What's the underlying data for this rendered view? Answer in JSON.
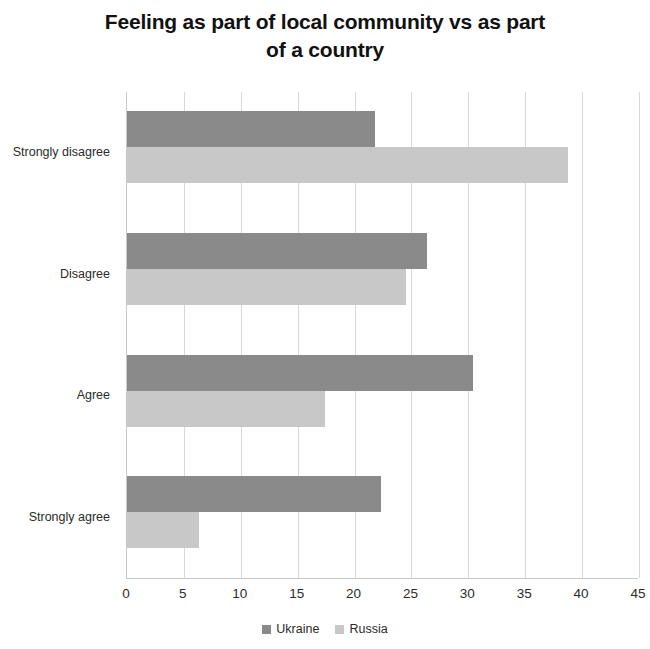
{
  "chart_data": {
    "type": "bar",
    "orientation": "horizontal",
    "title": "Feeling as part of local community vs as part of a country",
    "title_line1": "Feeling as part of local community vs as part",
    "title_line2": "of a country",
    "xlabel": "",
    "ylabel": "",
    "categories": [
      "Strongly disagree",
      "Disagree",
      "Agree",
      "Strongly agree"
    ],
    "series": [
      {
        "name": "Ukraine",
        "color": "#8a8a8a",
        "values": [
          21.8,
          26.4,
          30.4,
          22.3
        ]
      },
      {
        "name": "Russia",
        "color": "#c8c8c8",
        "values": [
          38.8,
          24.5,
          17.4,
          6.3
        ]
      }
    ],
    "xlim": [
      0,
      45
    ],
    "xticks": [
      0,
      5,
      10,
      15,
      20,
      25,
      30,
      35,
      40,
      45
    ],
    "xtick_labels": [
      "0",
      "5",
      "10",
      "15",
      "20",
      "25",
      "30",
      "35",
      "40",
      "45"
    ],
    "grid": true,
    "grid_axis": "x",
    "legend_position": "bottom",
    "legend_entries": [
      "Ukraine",
      "Russia"
    ],
    "colors": {
      "ukraine": "#8a8a8a",
      "russia": "#c8c8c8",
      "gridline": "#d9d9d9",
      "axis": "#c9c9c9",
      "text": "#2b2b2b",
      "title": "#111111",
      "background": "#ffffff"
    }
  }
}
